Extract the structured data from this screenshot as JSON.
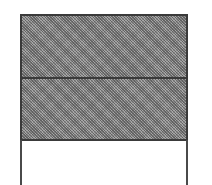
{
  "figure": {
    "bands": [
      {
        "name": "upper-panel",
        "fill": "stippled-gray"
      },
      {
        "name": "lower-panel",
        "fill": "stippled-gray"
      }
    ],
    "posts": [
      {
        "name": "left-post"
      },
      {
        "name": "right-post"
      }
    ],
    "colors": {
      "outline": "#3a3a3a",
      "fill": "#8c8c8c",
      "background": "#ffffff"
    }
  }
}
